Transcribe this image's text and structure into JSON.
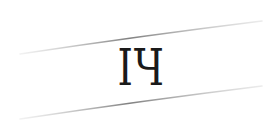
{
  "captcha": {
    "text": "IЧ",
    "characters": [
      "I",
      "Ч"
    ],
    "text_color": "#1a1a1a",
    "line_color": "#8a8a8a",
    "background": "#ffffff"
  }
}
